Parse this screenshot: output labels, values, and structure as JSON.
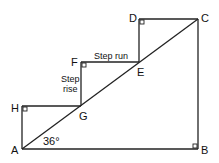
{
  "diagram": {
    "type": "staircase-geometry",
    "angle_label": "36°",
    "step_run_label": "Step run",
    "step_rise_label_line1": "Step",
    "step_rise_label_line2": "rise",
    "points": {
      "A": {
        "label": "A",
        "x": 22,
        "y": 149
      },
      "B": {
        "label": "B",
        "x": 198,
        "y": 149
      },
      "C": {
        "label": "C",
        "x": 198,
        "y": 19
      },
      "D": {
        "label": "D",
        "x": 139,
        "y": 19
      },
      "E": {
        "label": "E",
        "x": 139,
        "y": 62
      },
      "F": {
        "label": "F",
        "x": 81,
        "y": 62
      },
      "G": {
        "label": "G",
        "x": 81,
        "y": 106
      },
      "H": {
        "label": "H",
        "x": 22,
        "y": 106
      }
    },
    "right_angles": [
      "H",
      "F",
      "D",
      "B"
    ],
    "line_color": "#222222"
  }
}
